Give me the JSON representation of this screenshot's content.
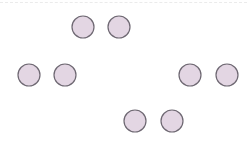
{
  "diagram": {
    "style": {
      "fill": "#e3d6e3",
      "stroke": "#6e6872",
      "stroke_width": 1.2,
      "radius": 11
    },
    "top_rule": {
      "visible": true,
      "color": "#ebebeb"
    },
    "groups": [
      {
        "name": "top-pair",
        "nodes": [
          {
            "cx": 83,
            "cy": 27
          },
          {
            "cx": 119,
            "cy": 27
          }
        ]
      },
      {
        "name": "middle-left-pair",
        "nodes": [
          {
            "cx": 29,
            "cy": 75
          },
          {
            "cx": 65,
            "cy": 75
          }
        ]
      },
      {
        "name": "middle-right-pair",
        "nodes": [
          {
            "cx": 190,
            "cy": 75
          },
          {
            "cx": 227,
            "cy": 75
          }
        ]
      },
      {
        "name": "bottom-pair",
        "nodes": [
          {
            "cx": 135,
            "cy": 121
          },
          {
            "cx": 172,
            "cy": 121
          }
        ]
      }
    ]
  }
}
